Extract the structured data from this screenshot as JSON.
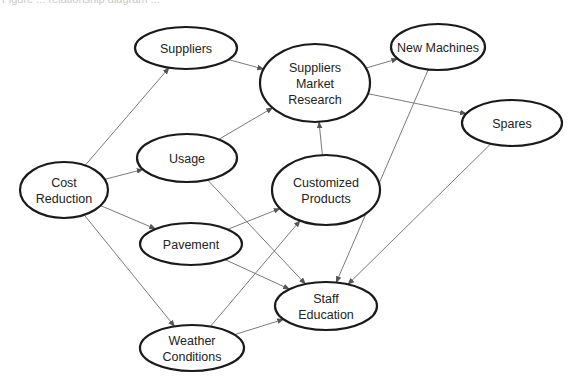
{
  "caption": "Figure ... relationship diagram ...",
  "diagram": {
    "type": "directed-graph",
    "colors": {
      "node_stroke": "#1a1a1a",
      "edge": "#7a7a7a",
      "text": "#222222",
      "background": "#ffffff"
    },
    "nodes": [
      {
        "id": "cost_reduction",
        "lines": [
          "Cost",
          "Reduction"
        ],
        "cx": 64,
        "cy": 190,
        "rx": 44,
        "ry": 28
      },
      {
        "id": "suppliers",
        "lines": [
          "Suppliers"
        ],
        "cx": 186,
        "cy": 48,
        "rx": 51,
        "ry": 21
      },
      {
        "id": "usage",
        "lines": [
          "Usage"
        ],
        "cx": 187,
        "cy": 158,
        "rx": 50,
        "ry": 24
      },
      {
        "id": "pavement",
        "lines": [
          "Pavement"
        ],
        "cx": 191,
        "cy": 244,
        "rx": 51,
        "ry": 21
      },
      {
        "id": "weather_conditions",
        "lines": [
          "Weather",
          "Conditions"
        ],
        "cx": 192,
        "cy": 348,
        "rx": 52,
        "ry": 23
      },
      {
        "id": "suppliers_market_research",
        "lines": [
          "Suppliers",
          "Market",
          "Research"
        ],
        "cx": 315,
        "cy": 83,
        "rx": 55,
        "ry": 39
      },
      {
        "id": "customized_products",
        "lines": [
          "Customized",
          "Products"
        ],
        "cx": 326,
        "cy": 190,
        "rx": 54,
        "ry": 35
      },
      {
        "id": "staff_education",
        "lines": [
          "Staff",
          "Education"
        ],
        "cx": 326,
        "cy": 306,
        "rx": 51,
        "ry": 24
      },
      {
        "id": "new_machines",
        "lines": [
          "New Machines"
        ],
        "cx": 438,
        "cy": 47,
        "rx": 47,
        "ry": 23
      },
      {
        "id": "spares",
        "lines": [
          "Spares"
        ],
        "cx": 512,
        "cy": 123,
        "rx": 50,
        "ry": 23
      }
    ],
    "edges": [
      {
        "from": "cost_reduction",
        "to": "suppliers"
      },
      {
        "from": "cost_reduction",
        "to": "usage"
      },
      {
        "from": "cost_reduction",
        "to": "pavement"
      },
      {
        "from": "cost_reduction",
        "to": "weather_conditions"
      },
      {
        "from": "suppliers",
        "to": "suppliers_market_research"
      },
      {
        "from": "usage",
        "to": "suppliers_market_research"
      },
      {
        "from": "usage",
        "to": "staff_education"
      },
      {
        "from": "pavement",
        "to": "customized_products"
      },
      {
        "from": "pavement",
        "to": "staff_education"
      },
      {
        "from": "weather_conditions",
        "to": "customized_products"
      },
      {
        "from": "weather_conditions",
        "to": "staff_education"
      },
      {
        "from": "customized_products",
        "to": "suppliers_market_research"
      },
      {
        "from": "suppliers_market_research",
        "to": "new_machines"
      },
      {
        "from": "suppliers_market_research",
        "to": "spares"
      },
      {
        "from": "new_machines",
        "to": "staff_education"
      },
      {
        "from": "spares",
        "to": "staff_education"
      }
    ]
  }
}
